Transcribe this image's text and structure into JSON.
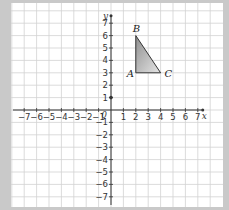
{
  "figure": {
    "x_axis_label": "x",
    "y_axis_label": "y",
    "origin_label": "0",
    "x_range": [
      -7,
      7
    ],
    "y_range": [
      -7,
      7
    ],
    "x_ticks": [
      "−7",
      "−6",
      "−5",
      "−4",
      "−3",
      "−2",
      "−1",
      "1",
      "2",
      "3",
      "4",
      "5",
      "6",
      "7"
    ],
    "y_ticks": [
      "7",
      "6",
      "5",
      "4",
      "3",
      "2",
      "1",
      "−1",
      "−2",
      "−3",
      "−4",
      "−5",
      "−6",
      "−7"
    ],
    "triangle": {
      "vertices": [
        {
          "label": "A",
          "x": 2,
          "y": 3
        },
        {
          "label": "B",
          "x": 2,
          "y": 6
        },
        {
          "label": "C",
          "x": 4,
          "y": 3
        }
      ],
      "fill": "#bdbdbd"
    },
    "marked_point": {
      "x": 0,
      "y": 1
    },
    "colors": {
      "background": "#c9c9c9",
      "panel": "#ffffff",
      "grid": "#cfcfcf",
      "axis": "#333333"
    }
  }
}
